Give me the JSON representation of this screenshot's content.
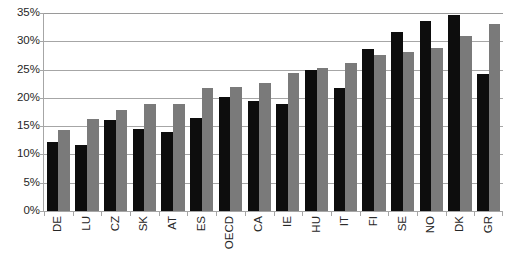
{
  "chart_data": {
    "type": "bar",
    "title": "",
    "subtitle": "",
    "xlabel": "",
    "ylabel": "",
    "ylim": [
      0,
      35
    ],
    "ytick_step": 5,
    "ytick_labels": [
      "0%",
      "5%",
      "10%",
      "15%",
      "20%",
      "25%",
      "30%",
      "35%"
    ],
    "ytick_values": [
      0,
      5,
      10,
      15,
      20,
      25,
      30,
      35
    ],
    "grid": true,
    "grid_axis": "y",
    "legend": false,
    "legend_position": "none",
    "value_format": "percent",
    "categories": [
      "DE",
      "LU",
      "CZ",
      "SK",
      "AT",
      "ES",
      "OECD",
      "CA",
      "IE",
      "HU",
      "IT",
      "FI",
      "SE",
      "NO",
      "DK",
      "GR"
    ],
    "series": [
      {
        "name": "series-1",
        "color": "#0d0d0d",
        "values": [
          12.2,
          11.7,
          16.1,
          14.5,
          14.0,
          16.5,
          20.1,
          19.5,
          19.0,
          24.9,
          21.7,
          28.7,
          31.6,
          33.6,
          34.6,
          24.2
        ]
      },
      {
        "name": "series-2",
        "color": "#7a7a7a",
        "values": [
          14.3,
          16.3,
          17.8,
          18.9,
          19.0,
          21.7,
          22.0,
          22.6,
          24.4,
          25.3,
          26.2,
          27.6,
          28.1,
          28.9,
          31.0,
          33.0
        ]
      }
    ]
  },
  "colors": {
    "series_1": "#0d0d0d",
    "series_2": "#7a7a7a",
    "gridline": "#a6a6a6",
    "axis": "#a6a6a6",
    "text": "#262626",
    "background": "#ffffff"
  }
}
